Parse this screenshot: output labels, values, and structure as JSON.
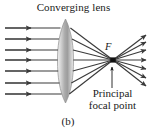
{
  "figure": {
    "title": "Converging lens",
    "focal_point_letter": "F",
    "annotation_line1": "Principal",
    "annotation_line2": "focal point",
    "panel_caption": "(b)",
    "colors": {
      "ink": "#1a1a1a",
      "ray": "#3a3a3a",
      "lens_light": "#e2e2e2",
      "lens_mid": "#b9b9b9",
      "lens_dark": "#9a9a9a",
      "lens_outline": "#8e8e8e",
      "background": "#ffffff"
    }
  },
  "optics": {
    "type": "ray-diagram",
    "element": "biconvex-converging-lens",
    "lens": {
      "center_x": 65.5,
      "top_y": 19,
      "bottom_y": 103,
      "half_thickness": 7.5
    },
    "optical_axis_y": 60,
    "focal_point": {
      "x": 113,
      "y": 60
    },
    "incoming_ray_count": 7,
    "incoming_ray_start_x": 5,
    "incoming_ray_arrow_x": 31,
    "incoming_ray_y": [
      28,
      39,
      50,
      60,
      71,
      83,
      94
    ],
    "outgoing_ray_end_x": 146,
    "pointer_arrow": {
      "x": 112,
      "from_y": 88,
      "to_y": 67
    }
  }
}
